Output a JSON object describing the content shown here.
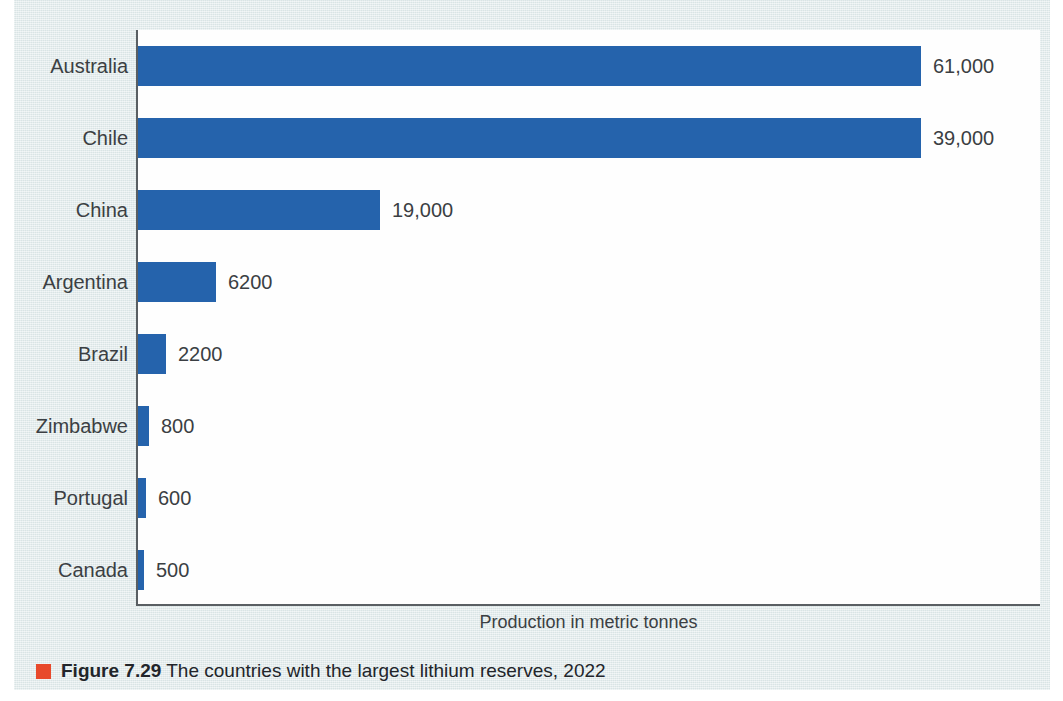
{
  "figure": {
    "caption_number": "Figure 7.29",
    "caption_text": " The countries with the largest lithium reserves, 2022",
    "marker_color": "#e8492b",
    "panel_background": "#dde8e9",
    "bar_color": "#2563ac",
    "text_color": "#3b3f43"
  },
  "chart_data": {
    "type": "bar",
    "orientation": "horizontal",
    "title": "",
    "subtitle": "",
    "xlabel": "Production in metric tonnes",
    "ylabel": "",
    "categories": [
      "Australia",
      "Chile",
      "China",
      "Argentina",
      "Brazil",
      "Zimbabwe",
      "Portugal",
      "Canada"
    ],
    "values": [
      61000,
      39000,
      19000,
      6200,
      2200,
      800,
      600,
      500
    ],
    "value_labels": [
      "61,000",
      "39,000",
      "19,000",
      "6200",
      "2200",
      "800",
      "600",
      "500"
    ],
    "bar_pixel_lengths": [
      783,
      783,
      242,
      78,
      28,
      11,
      8,
      6
    ],
    "grid": false,
    "legend": null,
    "xlim": [
      0,
      61000
    ],
    "note": "Top two bars are drawn to the same truncated length in the source figure"
  },
  "rows": [
    {
      "label": "Australia",
      "value_label": "61,000",
      "bar_px": 783
    },
    {
      "label": "Chile",
      "value_label": "39,000",
      "bar_px": 783
    },
    {
      "label": "China",
      "value_label": "19,000",
      "bar_px": 242
    },
    {
      "label": "Argentina",
      "value_label": "6200",
      "bar_px": 78
    },
    {
      "label": "Brazil",
      "value_label": "2200",
      "bar_px": 28
    },
    {
      "label": "Zimbabwe",
      "value_label": "800",
      "bar_px": 11
    },
    {
      "label": "Portugal",
      "value_label": "600",
      "bar_px": 8
    },
    {
      "label": "Canada",
      "value_label": "500",
      "bar_px": 6
    }
  ]
}
